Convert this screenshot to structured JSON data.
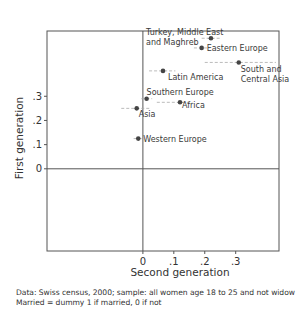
{
  "chart_data": {
    "type": "scatter",
    "title": "",
    "xlabel": "Second generation",
    "ylabel": "First generation",
    "xlim": [
      -0.31,
      0.44
    ],
    "ylim": [
      -0.34,
      0.57
    ],
    "x_ticks": [
      0,
      0.1,
      0.2,
      0.3
    ],
    "x_tick_labels": [
      "0",
      ".1",
      ".2",
      ".3"
    ],
    "y_ticks": [
      0,
      0.1,
      0.2,
      0.3
    ],
    "y_tick_labels": [
      "0",
      ".1",
      ".2",
      ".3"
    ],
    "grid": false,
    "reference_lines": {
      "x": 0,
      "y": 0
    },
    "legend": null,
    "points": [
      {
        "label": "Turkey, Middle East and Maghreb",
        "label_lines": [
          "Turkey, Middle East",
          "and Maghreb"
        ],
        "x": 0.22,
        "y": 0.54,
        "ci_x": [
          0.19,
          0.25
        ],
        "label_pos": "left-top"
      },
      {
        "label": "Eastern Europe",
        "label_lines": [
          "Eastern Europe"
        ],
        "x": 0.19,
        "y": 0.5,
        "ci_x": [
          0.165,
          0.215
        ],
        "label_pos": "right"
      },
      {
        "label": "South and Central Asia",
        "label_lines": [
          "South and",
          "Central Asia"
        ],
        "x": 0.31,
        "y": 0.44,
        "ci_x": [
          0.2,
          0.43
        ],
        "label_pos": "below-right"
      },
      {
        "label": "Latin America",
        "label_lines": [
          "Latin America"
        ],
        "x": 0.065,
        "y": 0.405,
        "ci_x": [
          0.02,
          0.105
        ],
        "label_pos": "below-right"
      },
      {
        "label": "Southern Europe",
        "label_lines": [
          "Southern Europe"
        ],
        "x": 0.012,
        "y": 0.29,
        "ci_x": [
          -0.005,
          0.03
        ],
        "label_pos": "above-right"
      },
      {
        "label": "Africa",
        "label_lines": [
          "Africa"
        ],
        "x": 0.12,
        "y": 0.275,
        "ci_x": [
          0.045,
          0.16
        ],
        "label_pos": "right"
      },
      {
        "label": "Asia",
        "label_lines": [
          "Asia"
        ],
        "x": -0.02,
        "y": 0.25,
        "ci_x": [
          -0.07,
          0.025
        ],
        "label_pos": "below-right"
      },
      {
        "label": "Western Europe",
        "label_lines": [
          "Western Europe"
        ],
        "x": -0.015,
        "y": 0.125,
        "ci_x": [
          -0.03,
          0.0
        ],
        "label_pos": "right"
      }
    ]
  },
  "caption": {
    "line1": "Data: Swiss census, 2000; sample: all women age 18 to 25 and not widow",
    "line2": "Married = dummy 1 if married, 0 if not"
  },
  "colors": {
    "frame": "#555555",
    "point": "#444444",
    "ci": "#aaaaaa",
    "text": "#3a3a3a"
  }
}
